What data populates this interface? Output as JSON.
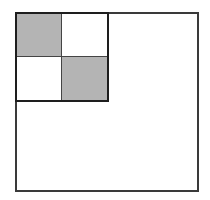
{
  "diagram": {
    "outer_square": {
      "fill": "#ffffff",
      "stroke": "#3a3a3a"
    },
    "inner_grid": {
      "rows": 2,
      "cols": 2,
      "stroke": "#1e1e1e",
      "cells": [
        {
          "row": 0,
          "col": 0,
          "shaded": true,
          "fill": "#b4b4b4"
        },
        {
          "row": 0,
          "col": 1,
          "shaded": false,
          "fill": "#ffffff"
        },
        {
          "row": 1,
          "col": 0,
          "shaded": false,
          "fill": "#ffffff"
        },
        {
          "row": 1,
          "col": 1,
          "shaded": true,
          "fill": "#b4b4b4"
        }
      ]
    }
  }
}
